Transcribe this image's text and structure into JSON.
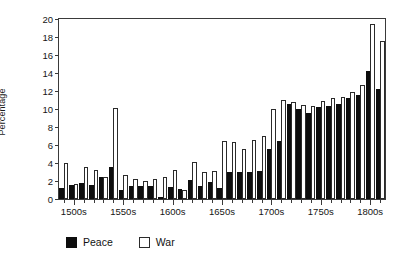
{
  "chart_data": {
    "type": "bar",
    "title": "",
    "subtitle": "",
    "xlabel": "",
    "ylabel": "Percentage",
    "ylim": [
      0,
      20
    ],
    "ytick_step": 2,
    "yticks": [
      0,
      2,
      4,
      6,
      8,
      10,
      12,
      14,
      16,
      18,
      20
    ],
    "grid": false,
    "legend_position": "below-axes-left",
    "categories": [
      "1490s",
      "1500s",
      "1510s",
      "1520s",
      "1530s",
      "1540s",
      "1550s",
      "1560s",
      "1570s",
      "1580s",
      "1590s",
      "1600s",
      "1610s",
      "1620s",
      "1630s",
      "1640s",
      "1650s",
      "1660s",
      "1670s",
      "1680s",
      "1690s",
      "1700s",
      "1710s",
      "1720s",
      "1730s",
      "1740s",
      "1750s",
      "1760s",
      "1770s",
      "1780s",
      "1790s",
      "1800s",
      "1810s"
    ],
    "xtick_labels": [
      "1500s",
      "1550s",
      "1600s",
      "1650s",
      "1700s",
      "1750s",
      "1800s"
    ],
    "xtick_label_categories": [
      "1500s",
      "1550s",
      "1600s",
      "1650s",
      "1700s",
      "1750s",
      "1800s"
    ],
    "series": [
      {
        "name": "Peace",
        "color": "#0d0d0d",
        "fill": "solid",
        "values": [
          1.2,
          1.6,
          1.8,
          1.6,
          2.4,
          3.6,
          1.0,
          1.5,
          1.4,
          1.5,
          0.2,
          1.3,
          1.1,
          2.1,
          1.5,
          1.9,
          1.2,
          3.0,
          3.0,
          3.0,
          3.1,
          5.6,
          6.4,
          10.6,
          10.0,
          9.6,
          10.2,
          10.3,
          10.6,
          11.2,
          11.6,
          14.2,
          12.2
        ]
      },
      {
        "name": "War",
        "color": "#ffffff",
        "fill": "outline",
        "values": [
          4.0,
          1.7,
          3.6,
          3.2,
          2.5,
          10.1,
          2.65,
          2.2,
          2.0,
          2.2,
          2.45,
          3.25,
          1.05,
          4.1,
          3.05,
          3.1,
          6.4,
          6.3,
          5.6,
          6.6,
          7.0,
          10.0,
          11.0,
          10.8,
          10.5,
          10.3,
          10.9,
          11.2,
          11.3,
          11.9,
          12.7,
          19.5,
          17.6
        ]
      }
    ]
  },
  "legend": {
    "items": [
      {
        "label": "Peace",
        "style": "solid-black"
      },
      {
        "label": "War",
        "style": "white-outline"
      }
    ]
  }
}
